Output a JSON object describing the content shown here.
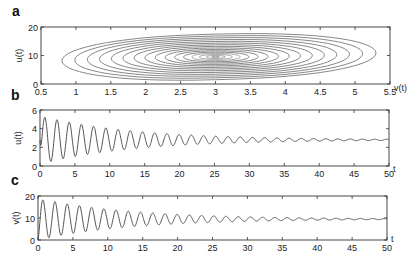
{
  "chart_data": [
    {
      "panel": "a",
      "type": "contour",
      "title": "",
      "xlabel": "v(t)",
      "ylabel": "u(t)",
      "xlim": [
        0.5,
        5.5
      ],
      "ylim": [
        0,
        20
      ],
      "xticks": [
        "0.5",
        "1",
        "1.5",
        "2",
        "2.5",
        "3",
        "3.5",
        "4",
        "4.5",
        "5",
        "5.5"
      ],
      "yticks": [
        "0",
        "10",
        "20"
      ],
      "grid": false,
      "center": {
        "x": 3.0,
        "y": 9.5
      },
      "contour_levels": 16,
      "outer_extent": {
        "x_min": 0.8,
        "x_max": 5.3,
        "y_min": 1.5,
        "y_max": 17.5
      },
      "color": "#555555"
    },
    {
      "panel": "b",
      "type": "line",
      "title": "",
      "xlabel": "t",
      "ylabel": "u(t)",
      "xlim": [
        0,
        50
      ],
      "ylim": [
        0,
        6
      ],
      "xticks": [
        "0",
        "5",
        "10",
        "15",
        "20",
        "25",
        "30",
        "35",
        "40",
        "45",
        "50"
      ],
      "yticks": [
        "0",
        "2",
        "4",
        "6"
      ],
      "grid": false,
      "series": [
        {
          "name": "u(t)",
          "description": "damped oscillation",
          "equilibrium": 2.8,
          "initial_amplitude": 2.6,
          "period": 1.75,
          "decay_rate": 0.075,
          "first_peak": 5.4,
          "first_trough": 0.9,
          "final_value": 2.8
        }
      ],
      "color": "#555555"
    },
    {
      "panel": "c",
      "type": "line",
      "title": "",
      "xlabel": "t",
      "ylabel": "v(t)",
      "xlim": [
        0,
        50
      ],
      "ylim": [
        0,
        20
      ],
      "xticks": [
        "0",
        "5",
        "10",
        "15",
        "20",
        "25",
        "30",
        "35",
        "40",
        "45",
        "50"
      ],
      "yticks": [
        "0",
        "10",
        "20"
      ],
      "grid": false,
      "series": [
        {
          "name": "v(t)",
          "description": "damped oscillation",
          "equilibrium": 9.5,
          "initial_amplitude": 9.5,
          "period": 1.75,
          "decay_rate": 0.075,
          "first_peak": 18.5,
          "first_trough": 1.5,
          "final_value": 9.5
        }
      ],
      "color": "#555555"
    }
  ],
  "panels": {
    "a": {
      "label": "a",
      "xlabel": "v(t)",
      "ylabel": "u(t)"
    },
    "b": {
      "label": "b",
      "xlabel": "t",
      "ylabel": "u(t)"
    },
    "c": {
      "label": "c",
      "xlabel": "t",
      "ylabel": "v(t)"
    }
  }
}
